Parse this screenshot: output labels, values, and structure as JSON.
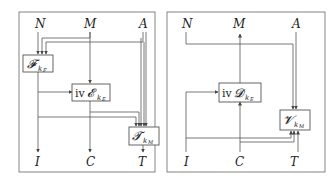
{
  "left_panel": {
    "nodes": {
      "N": "N",
      "M": "M",
      "A": "A",
      "I": "I",
      "C": "C",
      "T": "T"
    },
    "boxes": {
      "F": {
        "main": "𝓕",
        "sub": "k",
        "subsub": "F"
      },
      "E": {
        "prefix": "iv",
        "main": "𝓔",
        "sub": "k",
        "subsub": "E"
      },
      "Tm": {
        "main": "𝓣",
        "sub": "k",
        "subsub": "M"
      }
    }
  },
  "right_panel": {
    "nodes": {
      "N": "N",
      "M": "M",
      "A": "A",
      "I": "I",
      "C": "C",
      "T": "T"
    },
    "boxes": {
      "D": {
        "prefix": "iv",
        "main": "𝓓",
        "sub": "k",
        "subsub": "E"
      },
      "V": {
        "main": "𝓥",
        "sub": "k",
        "subsub": "M"
      }
    }
  }
}
